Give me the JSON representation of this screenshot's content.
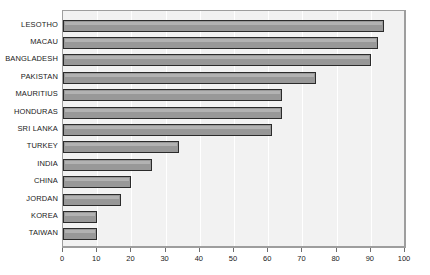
{
  "chart_data": {
    "type": "bar",
    "orientation": "horizontal",
    "title": "",
    "subtitle": "",
    "xlabel": "",
    "ylabel": "",
    "xlim": [
      0,
      100
    ],
    "xticks": [
      0,
      10,
      20,
      30,
      40,
      50,
      60,
      70,
      80,
      90,
      100
    ],
    "grid": "vertical",
    "legend": "none",
    "categories": [
      "LESOTHO",
      "MACAU",
      "BANGLADESH",
      "PAKISTAN",
      "MAURITIUS",
      "HONDURAS",
      "SRI LANKA",
      "TURKEY",
      "INDIA",
      "CHINA",
      "JORDAN",
      "KOREA",
      "TAIWAN"
    ],
    "values": [
      94,
      92,
      90,
      74,
      64,
      64,
      61,
      34,
      26,
      20,
      17,
      10,
      10
    ],
    "colors": {
      "bar_fill": "#989898",
      "bar_border": "#2b2b2b",
      "plot_background": "#f2f2f2",
      "gridline": "#ffffff",
      "frame_border": "#9e9e9e",
      "text": "#1a1a1a",
      "page_background": "#ffffff"
    }
  }
}
